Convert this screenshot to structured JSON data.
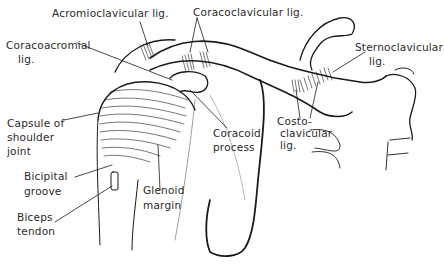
{
  "figure": {
    "colors": {
      "ink": "#1a1a1a",
      "label_text": "#2a2a2a",
      "background": "#ffffff"
    }
  },
  "labels": {
    "acromioclavicular": {
      "text": "Acromioclavicular lig."
    },
    "coracoclavicular": {
      "text": "Coracoclavicular lig."
    },
    "coracoacromial": {
      "line1": "Coracoacromial",
      "line2": "lig."
    },
    "sternoclavicular": {
      "line1": "Sternoclavicular",
      "line2": "lig."
    },
    "capsule": {
      "line1": "Capsule of",
      "line2": "shoulder",
      "line3": "joint"
    },
    "coracoid_process": {
      "line1": "Coracoid",
      "line2": "process"
    },
    "costoclavicular": {
      "line1": "Costo-",
      "line2": "clavicular",
      "line3": "lig."
    },
    "bicipital_groove": {
      "line1": "Bicipital",
      "line2": "groove"
    },
    "glenoid_margin": {
      "line1": "Glenoid",
      "line2": "margin"
    },
    "biceps_tendon": {
      "line1": "Biceps",
      "line2": "tendon"
    }
  }
}
